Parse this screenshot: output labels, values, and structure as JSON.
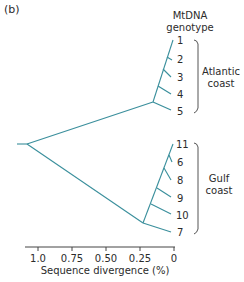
{
  "panel_label": "(b)",
  "header": {
    "line1": "MtDNA",
    "line2": "genotype"
  },
  "colors": {
    "branch": "#3a8f9c",
    "text": "#2b2b2b",
    "bracket": "#555555"
  },
  "groups": [
    {
      "name_line1": "Atlantic",
      "name_line2": "coast",
      "leaves": [
        "1",
        "2",
        "3",
        "4",
        "5"
      ]
    },
    {
      "name_line1": "Gulf",
      "name_line2": "coast",
      "leaves": [
        "11",
        "6",
        "8",
        "9",
        "10",
        "7"
      ]
    }
  ],
  "axis": {
    "title": "Sequence divergence (%)",
    "ticks": [
      "1.0",
      "0.75",
      "0.50",
      "0.25",
      "0"
    ]
  }
}
